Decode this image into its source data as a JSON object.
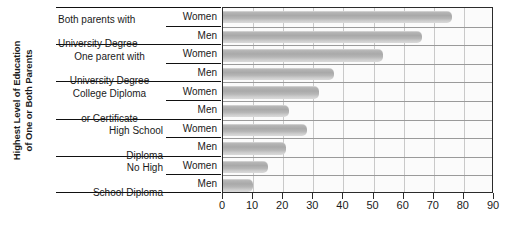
{
  "chart_data": {
    "type": "bar",
    "orientation": "horizontal",
    "title": "",
    "xlabel": "",
    "ylabel": "Highest Level of Education of One or Both Parents",
    "ylabel_lines": [
      "Highest Level of Education",
      "of One or Both Parents"
    ],
    "xlim": [
      0,
      90
    ],
    "xticks": [
      0,
      10,
      20,
      30,
      40,
      50,
      60,
      70,
      80,
      90
    ],
    "xtick_labels": [
      "0",
      "10",
      "20",
      "30",
      "40",
      "50",
      "60",
      "70",
      "80",
      "90"
    ],
    "grid": true,
    "grid_axis": "x",
    "legend": "none",
    "series_names": [
      "Women",
      "Men"
    ],
    "categories": [
      "Both parents with University Degree",
      "One parent with University Degree",
      "College Diploma or Certificate",
      "High School Diploma",
      "No High School Diploma"
    ],
    "series": [
      {
        "name": "Women",
        "values": [
          76,
          53,
          32,
          28,
          15
        ]
      },
      {
        "name": "Men",
        "values": [
          66,
          37,
          22,
          21,
          10
        ]
      }
    ],
    "bars": [
      {
        "category": "Both parents with University Degree",
        "series": "Women",
        "value": 76
      },
      {
        "category": "Both parents with University Degree",
        "series": "Men",
        "value": 66
      },
      {
        "category": "One parent with University Degree",
        "series": "Women",
        "value": 53
      },
      {
        "category": "One parent with University Degree",
        "series": "Men",
        "value": 37
      },
      {
        "category": "College Diploma or Certificate",
        "series": "Women",
        "value": 32
      },
      {
        "category": "College Diploma or Certificate",
        "series": "Men",
        "value": 22
      },
      {
        "category": "High School Diploma",
        "series": "Women",
        "value": 28
      },
      {
        "category": "High School Diploma",
        "series": "Men",
        "value": 21
      },
      {
        "category": "No High School Diploma",
        "series": "Women",
        "value": 15
      },
      {
        "category": "No High School Diploma",
        "series": "Men",
        "value": 10
      }
    ],
    "colors": {
      "bar_fill": "#ababab",
      "bar_highlight": "#d6d6d6",
      "plot_background": "#fbfbfb",
      "axis_line": "#2b2b2b",
      "gridline": "#c9c9c9",
      "text": "#1a1a1a"
    }
  },
  "category_labels": [
    {
      "line1": "Both parents with",
      "line2": "University Degree",
      "align": "left"
    },
    {
      "line1": "One parent with",
      "line2": "University Degree",
      "align": "center"
    },
    {
      "line1": "College Diploma",
      "line2": "or  Certificate",
      "align": "center"
    },
    {
      "line1": "High School",
      "line2": "Diploma",
      "align": "right"
    },
    {
      "line1": "No High",
      "line2": "School Diploma",
      "align": "right"
    }
  ],
  "series_labels": [
    "Women",
    "Men",
    "Women",
    "Men",
    "Women",
    "Men",
    "Women",
    "Men",
    "Women",
    "Men"
  ]
}
